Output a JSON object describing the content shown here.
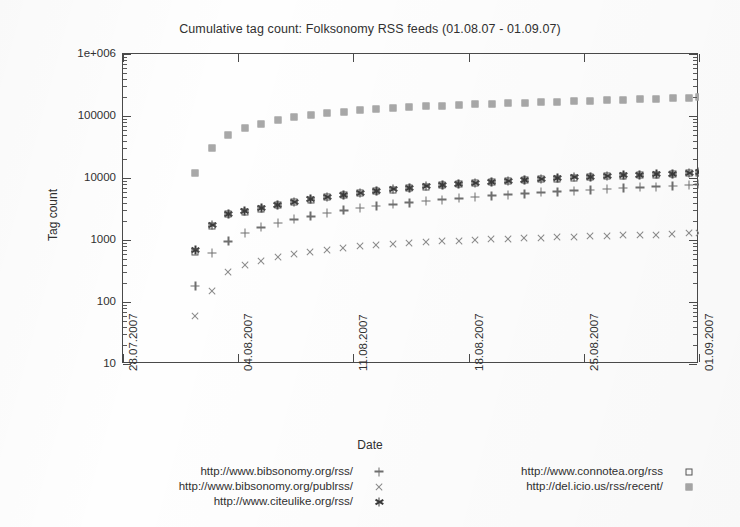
{
  "chart_data": {
    "type": "scatter",
    "title": "Cumulative tag count: Folksonomy RSS feeds (01.08.07 - 01.09.07)",
    "xlabel": "Date",
    "ylabel": "Tag count",
    "yscale": "log",
    "ylim": [
      10,
      1000000
    ],
    "ytick_labels": [
      "10",
      "100",
      "1000",
      "10000",
      "100000",
      "1e+006"
    ],
    "ytick_values": [
      10,
      100,
      1000,
      10000,
      100000,
      1000000
    ],
    "xtick_labels": [
      "28.07.2007",
      "04.08.2007",
      "11.08.2007",
      "18.08.2007",
      "25.08.2007",
      "01.09.2007"
    ],
    "xtick_values": [
      0,
      7,
      14,
      21,
      28,
      35
    ],
    "xlim": [
      0,
      35
    ],
    "grid": false,
    "legend_position": "below",
    "x": [
      4.4,
      5.4,
      6.4,
      7.4,
      8.4,
      9.4,
      10.4,
      11.4,
      12.4,
      13.4,
      14.4,
      15.4,
      16.4,
      17.4,
      18.4,
      19.4,
      20.4,
      21.4,
      22.4,
      23.4,
      24.4,
      25.4,
      26.4,
      27.4,
      28.4,
      29.4,
      30.4,
      31.4,
      32.4,
      33.4,
      34.4,
      35.0
    ],
    "series": [
      {
        "name": "http://www.bibsonomy.org/rss/",
        "marker": "plus",
        "color": "#6f6f6f",
        "values": [
          180,
          620,
          950,
          1300,
          1600,
          1900,
          2150,
          2400,
          2700,
          3000,
          3250,
          3500,
          3750,
          4000,
          4250,
          4500,
          4700,
          4950,
          5200,
          5400,
          5600,
          5850,
          6050,
          6250,
          6450,
          6650,
          6850,
          7050,
          7250,
          7450,
          7650,
          7900
        ]
      },
      {
        "name": "http://www.bibsonomy.org/publrss/",
        "marker": "cross",
        "color": "#8a8a8a",
        "values": [
          60,
          150,
          310,
          390,
          460,
          530,
          600,
          650,
          700,
          750,
          790,
          830,
          860,
          890,
          920,
          950,
          975,
          1000,
          1020,
          1045,
          1065,
          1085,
          1105,
          1125,
          1145,
          1165,
          1185,
          1205,
          1225,
          1250,
          1280,
          1320
        ]
      },
      {
        "name": "http://www.citeulike.org/rss/",
        "marker": "star",
        "color": "#3a3a3a",
        "values": [
          680,
          1750,
          2650,
          2950,
          3250,
          3700,
          4150,
          4600,
          5000,
          5400,
          5800,
          6200,
          6600,
          7000,
          7350,
          7700,
          8050,
          8400,
          8750,
          9050,
          9350,
          9650,
          9950,
          10250,
          10500,
          10800,
          11050,
          11300,
          11550,
          11800,
          12050,
          12400
        ]
      },
      {
        "name": "http://www.connotea.org/rss",
        "marker": "open-square",
        "color": "#555555",
        "values": [
          650,
          1700,
          2580,
          2880,
          3180,
          3620,
          4060,
          4500,
          4900,
          5300,
          5700,
          6100,
          6480,
          6880,
          7220,
          7570,
          7900,
          8250,
          8600,
          8900,
          9180,
          9480,
          9780,
          10050,
          10300,
          10600,
          10850,
          11100,
          11350,
          11600,
          11850,
          12150
        ]
      },
      {
        "name": "http://del.icio.us/rss/recent/",
        "marker": "filled-square",
        "color": "#a8a8a8",
        "values": [
          12000,
          30000,
          50000,
          64000,
          75000,
          86000,
          95000,
          103000,
          110000,
          117000,
          123000,
          129000,
          134000,
          139000,
          143000,
          147000,
          151000,
          155000,
          158000,
          162000,
          165000,
          168000,
          171000,
          174000,
          177000,
          180000,
          183000,
          186000,
          189000,
          192000,
          195000,
          199000
        ]
      }
    ]
  },
  "legend": {
    "columns": [
      {
        "entries": [
          {
            "label": "http://www.bibsonomy.org/rss/",
            "marker": "plus"
          },
          {
            "label": "http://www.bibsonomy.org/publrss/",
            "marker": "cross"
          },
          {
            "label": "http://www.citeulike.org/rss/",
            "marker": "star"
          }
        ]
      },
      {
        "entries": [
          {
            "label": "http://www.connotea.org/rss",
            "marker": "open-square"
          },
          {
            "label": "http://del.icio.us/rss/recent/",
            "marker": "filled-square"
          }
        ]
      }
    ]
  }
}
